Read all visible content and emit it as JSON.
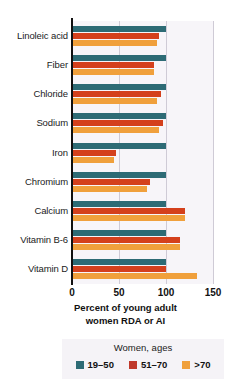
{
  "chart_data": {
    "type": "bar",
    "orientation": "horizontal",
    "title": "",
    "xlabel": "Percent of young adult women RDA or AI",
    "ylabel": "",
    "xlim": [
      0,
      150
    ],
    "xticks": [
      0,
      50,
      100,
      150
    ],
    "grid": true,
    "legend_position": "bottom",
    "legend_title": "Women, ages",
    "categories": [
      "Linoleic acid",
      "Fiber",
      "Chloride",
      "Sodium",
      "Iron",
      "Chromium",
      "Calcium",
      "Vitamin B-6",
      "Vitamin D"
    ],
    "series": [
      {
        "name": "19–50",
        "color": "#2d6b75",
        "values": [
          100,
          100,
          100,
          100,
          100,
          100,
          100,
          100,
          100
        ]
      },
      {
        "name": "51–70",
        "color": "#d4401c",
        "values": [
          93,
          87,
          95,
          97,
          47,
          83,
          120,
          115,
          100
        ]
      },
      {
        "name": ">70",
        "color": "#f0a03c",
        "values": [
          90,
          87,
          90,
          93,
          45,
          80,
          120,
          115,
          133
        ]
      }
    ]
  },
  "axis": {
    "xtick_labels": [
      "0",
      "50",
      "100",
      "150"
    ],
    "xaxis_title_line1": "Percent of young adult",
    "xaxis_title_line2": "women RDA or AI"
  },
  "legend": {
    "title": "Women, ages",
    "items": [
      {
        "label": "19–50",
        "color": "#2d6b75"
      },
      {
        "label": "51–70",
        "color": "#c0392b"
      },
      {
        "label": ">70",
        "color": "#f0a03c"
      }
    ]
  },
  "colors": {
    "series_1": "#2d6b75",
    "series_2": "#d4401c",
    "series_3": "#f0a03c",
    "plot_background": "#f7f5f9",
    "gridline": "#cfcbd6",
    "axis": "#111111",
    "legend_background": "#f5f3f7"
  }
}
